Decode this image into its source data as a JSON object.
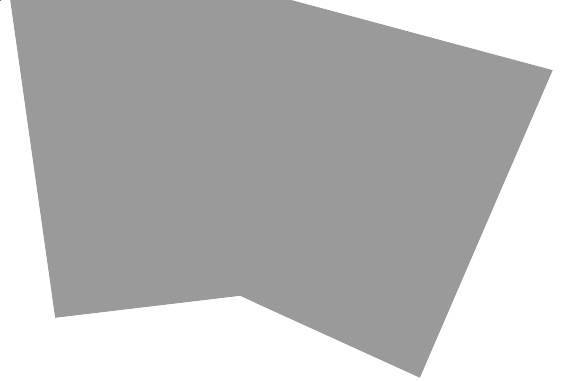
{
  "diagram": {
    "type": "folding-instruction",
    "canvas": {
      "width": 585,
      "height": 381,
      "background": "#ffffff"
    },
    "sheet": {
      "pattern": "swirl-spirals",
      "pattern_line_color": "#7a7a7a",
      "pattern_bg_color": "#ffffff",
      "outline": [
        [
          10,
          0
        ],
        [
          292,
          0
        ],
        [
          553,
          70
        ],
        [
          420,
          378
        ],
        [
          240,
          296
        ],
        [
          55,
          318
        ]
      ]
    },
    "crease": {
      "color": "#ffffff",
      "points": [
        [
          272,
          0
        ],
        [
          268,
          100
        ],
        [
          262,
          180
        ],
        [
          252,
          250
        ],
        [
          243,
          292
        ]
      ]
    },
    "flap": {
      "fill": "#ffffff",
      "stroke": "#555555",
      "points": [
        [
          553,
          70
        ],
        [
          583,
          118
        ],
        [
          455,
          377
        ],
        [
          420,
          377
        ]
      ]
    },
    "arrow": {
      "direction": "down",
      "color": "#222222",
      "x": 563,
      "y_start": 0,
      "y_end": 136
    },
    "spirals": [
      {
        "cx": 30,
        "cy": 20,
        "r": 17
      },
      {
        "cx": 70,
        "cy": 12,
        "r": 15
      },
      {
        "cx": 110,
        "cy": 22,
        "r": 18
      },
      {
        "cx": 150,
        "cy": 10,
        "r": 15
      },
      {
        "cx": 190,
        "cy": 22,
        "r": 18
      },
      {
        "cx": 232,
        "cy": 12,
        "r": 16
      },
      {
        "cx": 272,
        "cy": 24,
        "r": 18
      },
      {
        "cx": 312,
        "cy": 14,
        "r": 15
      },
      {
        "cx": 350,
        "cy": 30,
        "r": 17
      },
      {
        "cx": 392,
        "cy": 34,
        "r": 16
      },
      {
        "cx": 432,
        "cy": 44,
        "r": 17
      },
      {
        "cx": 472,
        "cy": 54,
        "r": 16
      },
      {
        "cx": 512,
        "cy": 66,
        "r": 15
      },
      {
        "cx": 40,
        "cy": 58,
        "r": 18
      },
      {
        "cx": 82,
        "cy": 50,
        "r": 16
      },
      {
        "cx": 122,
        "cy": 62,
        "r": 19
      },
      {
        "cx": 165,
        "cy": 52,
        "r": 16
      },
      {
        "cx": 205,
        "cy": 64,
        "r": 18
      },
      {
        "cx": 248,
        "cy": 54,
        "r": 16
      },
      {
        "cx": 290,
        "cy": 64,
        "r": 19
      },
      {
        "cx": 332,
        "cy": 56,
        "r": 16
      },
      {
        "cx": 372,
        "cy": 70,
        "r": 18
      },
      {
        "cx": 414,
        "cy": 80,
        "r": 16
      },
      {
        "cx": 455,
        "cy": 90,
        "r": 18
      },
      {
        "cx": 497,
        "cy": 102,
        "r": 16
      },
      {
        "cx": 530,
        "cy": 92,
        "r": 13
      },
      {
        "cx": 30,
        "cy": 98,
        "r": 16
      },
      {
        "cx": 66,
        "cy": 92,
        "r": 17
      },
      {
        "cx": 106,
        "cy": 102,
        "r": 17
      },
      {
        "cx": 148,
        "cy": 94,
        "r": 18
      },
      {
        "cx": 190,
        "cy": 106,
        "r": 17
      },
      {
        "cx": 230,
        "cy": 96,
        "r": 18
      },
      {
        "cx": 272,
        "cy": 108,
        "r": 17
      },
      {
        "cx": 314,
        "cy": 98,
        "r": 18
      },
      {
        "cx": 356,
        "cy": 110,
        "r": 17
      },
      {
        "cx": 398,
        "cy": 120,
        "r": 18
      },
      {
        "cx": 440,
        "cy": 128,
        "r": 17
      },
      {
        "cx": 480,
        "cy": 140,
        "r": 17
      },
      {
        "cx": 516,
        "cy": 128,
        "r": 14
      },
      {
        "cx": 40,
        "cy": 138,
        "r": 17
      },
      {
        "cx": 80,
        "cy": 132,
        "r": 16
      },
      {
        "cx": 120,
        "cy": 142,
        "r": 18
      },
      {
        "cx": 162,
        "cy": 136,
        "r": 17
      },
      {
        "cx": 204,
        "cy": 146,
        "r": 18
      },
      {
        "cx": 246,
        "cy": 138,
        "r": 17
      },
      {
        "cx": 288,
        "cy": 148,
        "r": 18
      },
      {
        "cx": 330,
        "cy": 140,
        "r": 17
      },
      {
        "cx": 372,
        "cy": 152,
        "r": 18
      },
      {
        "cx": 414,
        "cy": 160,
        "r": 17
      },
      {
        "cx": 456,
        "cy": 170,
        "r": 18
      },
      {
        "cx": 494,
        "cy": 168,
        "r": 14
      },
      {
        "cx": 44,
        "cy": 176,
        "r": 16
      },
      {
        "cx": 86,
        "cy": 172,
        "r": 17
      },
      {
        "cx": 128,
        "cy": 182,
        "r": 18
      },
      {
        "cx": 170,
        "cy": 176,
        "r": 17
      },
      {
        "cx": 212,
        "cy": 186,
        "r": 18
      },
      {
        "cx": 254,
        "cy": 178,
        "r": 17
      },
      {
        "cx": 296,
        "cy": 188,
        "r": 18
      },
      {
        "cx": 338,
        "cy": 182,
        "r": 17
      },
      {
        "cx": 380,
        "cy": 192,
        "r": 18
      },
      {
        "cx": 422,
        "cy": 200,
        "r": 17
      },
      {
        "cx": 462,
        "cy": 208,
        "r": 16
      },
      {
        "cx": 484,
        "cy": 196,
        "r": 10
      },
      {
        "cx": 48,
        "cy": 214,
        "r": 15
      },
      {
        "cx": 90,
        "cy": 210,
        "r": 17
      },
      {
        "cx": 132,
        "cy": 220,
        "r": 18
      },
      {
        "cx": 174,
        "cy": 214,
        "r": 17
      },
      {
        "cx": 216,
        "cy": 224,
        "r": 18
      },
      {
        "cx": 258,
        "cy": 218,
        "r": 17
      },
      {
        "cx": 300,
        "cy": 228,
        "r": 18
      },
      {
        "cx": 342,
        "cy": 222,
        "r": 17
      },
      {
        "cx": 384,
        "cy": 232,
        "r": 18
      },
      {
        "cx": 424,
        "cy": 240,
        "r": 17
      },
      {
        "cx": 456,
        "cy": 244,
        "r": 13
      },
      {
        "cx": 52,
        "cy": 252,
        "r": 15
      },
      {
        "cx": 94,
        "cy": 248,
        "r": 17
      },
      {
        "cx": 136,
        "cy": 258,
        "r": 18
      },
      {
        "cx": 178,
        "cy": 252,
        "r": 17
      },
      {
        "cx": 220,
        "cy": 262,
        "r": 17
      },
      {
        "cx": 262,
        "cy": 258,
        "r": 17
      },
      {
        "cx": 304,
        "cy": 266,
        "r": 18
      },
      {
        "cx": 346,
        "cy": 262,
        "r": 17
      },
      {
        "cx": 388,
        "cy": 272,
        "r": 18
      },
      {
        "cx": 426,
        "cy": 278,
        "r": 15
      },
      {
        "cx": 58,
        "cy": 290,
        "r": 15
      },
      {
        "cx": 100,
        "cy": 288,
        "r": 16
      },
      {
        "cx": 142,
        "cy": 294,
        "r": 17
      },
      {
        "cx": 184,
        "cy": 290,
        "r": 16
      },
      {
        "cx": 224,
        "cy": 294,
        "r": 15
      },
      {
        "cx": 270,
        "cy": 298,
        "r": 16
      },
      {
        "cx": 312,
        "cy": 304,
        "r": 17
      },
      {
        "cx": 354,
        "cy": 300,
        "r": 17
      },
      {
        "cx": 396,
        "cy": 312,
        "r": 17
      },
      {
        "cx": 420,
        "cy": 300,
        "r": 12
      },
      {
        "cx": 300,
        "cy": 332,
        "r": 14
      },
      {
        "cx": 338,
        "cy": 338,
        "r": 15
      },
      {
        "cx": 376,
        "cy": 346,
        "r": 16
      },
      {
        "cx": 406,
        "cy": 352,
        "r": 13
      },
      {
        "cx": 392,
        "cy": 370,
        "r": 12
      }
    ]
  }
}
